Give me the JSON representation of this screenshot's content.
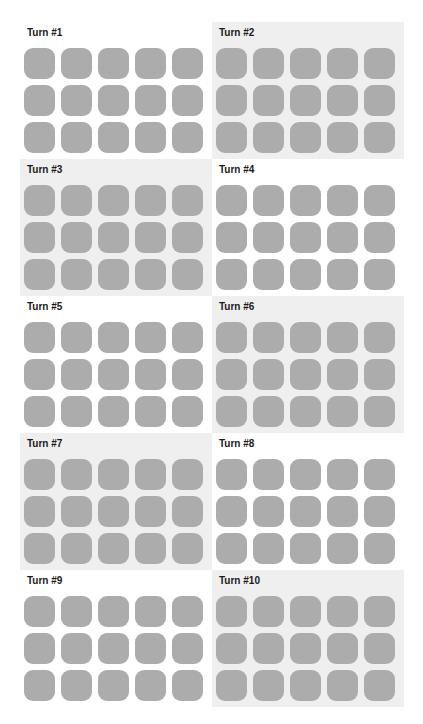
{
  "colors": {
    "tile": "#acacac",
    "shaded_panel": "#efefef",
    "plain_panel": "#ffffff",
    "title": "#1a1a1a"
  },
  "grid": {
    "rows": 3,
    "cols": 5
  },
  "panels": [
    {
      "title": "Turn #1",
      "shaded": false
    },
    {
      "title": "Turn #2",
      "shaded": true
    },
    {
      "title": "Turn #3",
      "shaded": true
    },
    {
      "title": "Turn #4",
      "shaded": false
    },
    {
      "title": "Turn #5",
      "shaded": false
    },
    {
      "title": "Turn #6",
      "shaded": true
    },
    {
      "title": "Turn #7",
      "shaded": true
    },
    {
      "title": "Turn #8",
      "shaded": false
    },
    {
      "title": "Turn #9",
      "shaded": false
    },
    {
      "title": "Turn #10",
      "shaded": true
    }
  ]
}
